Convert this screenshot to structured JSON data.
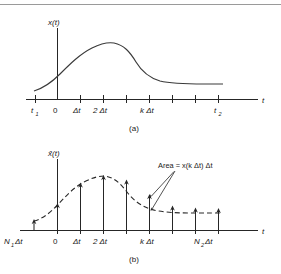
{
  "figure": {
    "type": "diagram",
    "panels": [
      {
        "id": "a",
        "caption": "(a)",
        "y_axis_label": "x(t)",
        "x_axis_label": "t",
        "x_tick_labels": [
          "t",
          "0",
          "Δt",
          "2 Δt",
          "k Δt",
          "t"
        ],
        "x_tick_label_subs": [
          "1",
          "",
          "",
          "",
          "",
          "2"
        ],
        "curve_style": "solid"
      },
      {
        "id": "b",
        "caption": "(b)",
        "y_axis_label": "x̂(t)",
        "x_axis_label": "t",
        "x_tick_labels": [
          "N",
          "0",
          "Δt",
          "2 Δt",
          "k Δt",
          "N"
        ],
        "x_tick_label_subs": [
          "1",
          "",
          "",
          "",
          "",
          "2"
        ],
        "x_tick_label_tails": [
          " Δt",
          "",
          "",
          "",
          "",
          " Δt"
        ],
        "curve_style": "dashed",
        "annotation": "Area = x(k Δt) Δt"
      }
    ],
    "colors": {
      "ink": "#1a1a1a",
      "curve": "#3a3a3a",
      "rule": "#9a9a9a",
      "background": "#ffffff"
    }
  },
  "labels": {
    "x_of_t": "x(t)",
    "xhat_of_t": "x̂(t)",
    "t": "t",
    "zero": "0",
    "dt": "Δt",
    "two_dt": "2 Δt",
    "k_dt": "k Δt",
    "t1_base": "t",
    "t1_sub": "1",
    "t2_base": "t",
    "t2_sub": "2",
    "N1_base": "N",
    "N1_sub": "1",
    "N1_tail": "Δt",
    "N2_base": "N",
    "N2_sub": "2",
    "N2_tail": "Δt",
    "area_note": "Area = x(k Δt) Δt",
    "caption_a": "(a)",
    "caption_b": "(b)"
  }
}
